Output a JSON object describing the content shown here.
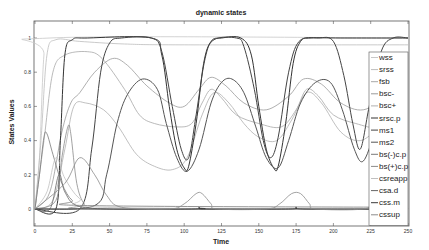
{
  "chart_data": {
    "type": "line",
    "title": "dynamic states",
    "xlabel": "Time",
    "ylabel": "States Values",
    "xlim": [
      0,
      250
    ],
    "ylim": [
      -0.1,
      1.05
    ],
    "xticks": [
      0,
      25,
      50,
      75,
      100,
      125,
      150,
      175,
      200,
      225,
      250
    ],
    "yticks": [
      0,
      0.2,
      0.4,
      0.6,
      0.8,
      1
    ],
    "ytick_labels": [
      "0",
      "0.2",
      "0.4",
      "0.6",
      "0.8",
      "1"
    ],
    "grid": false,
    "legend_position": "east-inside",
    "series": [
      {
        "name": "wss",
        "color": "#c8c8c8",
        "width": 0.8,
        "points": [
          [
            0,
            0
          ],
          [
            3,
            0.3
          ],
          [
            6,
            0.9
          ],
          [
            10,
            1.0
          ],
          [
            250,
            1.0
          ]
        ]
      },
      {
        "name": "srss",
        "color": "#bdbdbd",
        "width": 0.8,
        "points": [
          [
            0,
            0
          ],
          [
            4,
            0.4
          ],
          [
            8,
            0.9
          ],
          [
            14,
            0.99
          ],
          [
            30,
            0.98
          ],
          [
            60,
            0.965
          ],
          [
            100,
            0.96
          ],
          [
            250,
            0.96
          ]
        ]
      },
      {
        "name": "fsb",
        "color": "#a8a8a8",
        "width": 0.8,
        "points": [
          [
            0,
            0
          ],
          [
            6,
            0.4
          ],
          [
            12,
            0.8
          ],
          [
            20,
            0.9
          ],
          [
            35,
            0.92
          ],
          [
            45,
            0.88
          ],
          [
            60,
            0.7
          ],
          [
            70,
            0.55
          ],
          [
            80,
            0.5
          ],
          [
            95,
            0.48
          ],
          [
            105,
            0.5
          ],
          [
            112,
            0.62
          ],
          [
            118,
            0.7
          ],
          [
            125,
            0.65
          ],
          [
            135,
            0.55
          ],
          [
            150,
            0.5
          ],
          [
            165,
            0.48
          ],
          [
            175,
            0.58
          ],
          [
            182,
            0.7
          ],
          [
            190,
            0.66
          ],
          [
            200,
            0.55
          ],
          [
            215,
            0.5
          ],
          [
            230,
            0.48
          ],
          [
            240,
            0.58
          ],
          [
            250,
            0.62
          ]
        ]
      },
      {
        "name": "bsc-",
        "color": "#9a9a9a",
        "width": 0.8,
        "points": [
          [
            0,
            0
          ],
          [
            10,
            0.1
          ],
          [
            18,
            0.45
          ],
          [
            24,
            0.62
          ],
          [
            30,
            0.68
          ],
          [
            40,
            0.8
          ],
          [
            52,
            0.88
          ],
          [
            62,
            0.84
          ],
          [
            75,
            0.72
          ],
          [
            90,
            0.62
          ],
          [
            100,
            0.6
          ],
          [
            110,
            0.7
          ],
          [
            118,
            0.77
          ],
          [
            128,
            0.72
          ],
          [
            140,
            0.62
          ],
          [
            155,
            0.58
          ],
          [
            170,
            0.66
          ],
          [
            180,
            0.76
          ],
          [
            192,
            0.73
          ],
          [
            205,
            0.62
          ],
          [
            220,
            0.58
          ],
          [
            235,
            0.66
          ],
          [
            242,
            0.76
          ],
          [
            250,
            0.72
          ]
        ]
      },
      {
        "name": "bsc+",
        "color": "#b0b0b0",
        "width": 0.8,
        "points": [
          [
            0,
            0
          ],
          [
            12,
            0.05
          ],
          [
            20,
            0.35
          ],
          [
            26,
            0.6
          ],
          [
            34,
            0.62
          ],
          [
            46,
            0.58
          ],
          [
            56,
            0.48
          ],
          [
            68,
            0.32
          ],
          [
            80,
            0.25
          ],
          [
            92,
            0.23
          ],
          [
            102,
            0.3
          ],
          [
            112,
            0.55
          ],
          [
            120,
            0.68
          ],
          [
            130,
            0.62
          ],
          [
            140,
            0.5
          ],
          [
            150,
            0.42
          ],
          [
            162,
            0.4
          ],
          [
            172,
            0.52
          ],
          [
            182,
            0.68
          ],
          [
            192,
            0.62
          ],
          [
            205,
            0.45
          ],
          [
            218,
            0.4
          ],
          [
            230,
            0.48
          ],
          [
            242,
            0.62
          ],
          [
            250,
            0.68
          ]
        ]
      },
      {
        "name": "srsc.p",
        "color": "#333333",
        "width": 1.0,
        "points": [
          [
            0,
            0
          ],
          [
            14,
            0
          ],
          [
            17,
            0.4
          ],
          [
            20,
            0.9
          ],
          [
            25,
            0.99
          ],
          [
            35,
            1.0
          ],
          [
            78,
            1.0
          ],
          [
            85,
            0.9
          ],
          [
            90,
            0.6
          ],
          [
            95,
            0.35
          ],
          [
            100,
            0.24
          ],
          [
            103,
            0.25
          ],
          [
            108,
            0.5
          ],
          [
            113,
            0.85
          ],
          [
            118,
            0.98
          ],
          [
            125,
            1.0
          ],
          [
            138,
            1.0
          ],
          [
            145,
            0.9
          ],
          [
            150,
            0.6
          ],
          [
            155,
            0.35
          ],
          [
            160,
            0.24
          ],
          [
            163,
            0.25
          ],
          [
            168,
            0.5
          ],
          [
            173,
            0.85
          ],
          [
            178,
            0.98
          ],
          [
            185,
            1.0
          ],
          [
            205,
            1.0
          ],
          [
            250,
            1.0
          ]
        ]
      },
      {
        "name": "ms1",
        "color": "#444444",
        "width": 1.0,
        "points": [
          [
            0,
            0
          ],
          [
            30,
            0
          ],
          [
            38,
            0.35
          ],
          [
            44,
            0.8
          ],
          [
            50,
            0.97
          ],
          [
            58,
            1.0
          ],
          [
            78,
            1.0
          ],
          [
            85,
            0.92
          ],
          [
            92,
            0.6
          ],
          [
            98,
            0.35
          ],
          [
            103,
            0.3
          ],
          [
            108,
            0.55
          ],
          [
            114,
            0.88
          ],
          [
            120,
            0.99
          ],
          [
            135,
            1.0
          ],
          [
            140,
            0.95
          ],
          [
            147,
            0.7
          ],
          [
            153,
            0.4
          ],
          [
            158,
            0.3
          ],
          [
            163,
            0.42
          ],
          [
            170,
            0.8
          ],
          [
            177,
            0.98
          ],
          [
            190,
            1.0
          ],
          [
            200,
            0.98
          ],
          [
            207,
            0.78
          ],
          [
            213,
            0.5
          ],
          [
            218,
            0.35
          ],
          [
            224,
            0.6
          ],
          [
            232,
            0.92
          ],
          [
            240,
            1.0
          ],
          [
            250,
            1.0
          ]
        ]
      },
      {
        "name": "ms2",
        "color": "#555555",
        "width": 1.0,
        "points": [
          [
            0,
            0
          ],
          [
            40,
            0.02
          ],
          [
            48,
            0.2
          ],
          [
            55,
            0.5
          ],
          [
            62,
            0.67
          ],
          [
            72,
            0.76
          ],
          [
            82,
            0.7
          ],
          [
            88,
            0.5
          ],
          [
            95,
            0.3
          ],
          [
            102,
            0.22
          ],
          [
            110,
            0.35
          ],
          [
            118,
            0.62
          ],
          [
            125,
            0.74
          ],
          [
            132,
            0.76
          ],
          [
            140,
            0.68
          ],
          [
            148,
            0.48
          ],
          [
            155,
            0.3
          ],
          [
            163,
            0.24
          ],
          [
            170,
            0.4
          ],
          [
            178,
            0.62
          ],
          [
            188,
            0.74
          ],
          [
            198,
            0.74
          ],
          [
            206,
            0.58
          ],
          [
            214,
            0.35
          ],
          [
            220,
            0.28
          ],
          [
            228,
            0.45
          ],
          [
            238,
            0.68
          ],
          [
            250,
            0.75
          ]
        ]
      },
      {
        "name": "bs(-)c.p",
        "color": "#7a7a7a",
        "width": 0.8,
        "points": [
          [
            0,
            0
          ],
          [
            3,
            0.2
          ],
          [
            6,
            0.42
          ],
          [
            8,
            0.44
          ],
          [
            12,
            0.32
          ],
          [
            18,
            0.15
          ],
          [
            25,
            0.05
          ],
          [
            35,
            0.02
          ],
          [
            250,
            0.01
          ]
        ]
      },
      {
        "name": "bs(+)c.p",
        "color": "#8a8a8a",
        "width": 0.8,
        "points": [
          [
            0,
            0
          ],
          [
            14,
            0.05
          ],
          [
            18,
            0.3
          ],
          [
            22,
            0.48
          ],
          [
            24,
            0.44
          ],
          [
            28,
            0.15
          ],
          [
            33,
            0.03
          ],
          [
            40,
            0
          ],
          [
            250,
            0
          ]
        ]
      },
      {
        "name": "csreapp",
        "color": "#c0c0c0",
        "width": 0.8,
        "points": [
          [
            0,
            0
          ],
          [
            8,
            0.1
          ],
          [
            14,
            0.3
          ],
          [
            20,
            0.18
          ],
          [
            30,
            0.06
          ],
          [
            45,
            0.01
          ],
          [
            250,
            0
          ]
        ]
      },
      {
        "name": "csa.d",
        "color": "#666666",
        "width": 0.8,
        "points": [
          [
            0,
            0
          ],
          [
            10,
            0
          ],
          [
            16,
            0.2
          ],
          [
            20,
            0.1
          ],
          [
            28,
            0.02
          ],
          [
            50,
            0
          ],
          [
            105,
            0
          ],
          [
            110,
            0.01
          ],
          [
            115,
            0.0
          ],
          [
            170,
            0
          ],
          [
            175,
            0.01
          ],
          [
            180,
            0
          ],
          [
            235,
            0
          ],
          [
            240,
            0.01
          ],
          [
            250,
            0
          ]
        ]
      },
      {
        "name": "css.m",
        "color": "#3a3a3a",
        "width": 0.8,
        "points": [
          [
            0,
            0
          ],
          [
            105,
            0
          ],
          [
            110,
            0.005
          ],
          [
            116,
            0
          ],
          [
            170,
            0
          ],
          [
            175,
            0.005
          ],
          [
            181,
            0
          ],
          [
            232,
            0
          ],
          [
            238,
            0.005
          ],
          [
            245,
            0
          ],
          [
            250,
            0
          ]
        ]
      },
      {
        "name": "cssup",
        "color": "#8c8c8c",
        "width": 0.8,
        "points": [
          [
            0,
            0
          ],
          [
            20,
            0.15
          ],
          [
            30,
            0.3
          ],
          [
            40,
            0.2
          ],
          [
            48,
            0.08
          ],
          [
            58,
            0.01
          ],
          [
            90,
            0
          ],
          [
            100,
            0.03
          ],
          [
            108,
            0.09
          ],
          [
            112,
            0.09
          ],
          [
            118,
            0.03
          ],
          [
            122,
            0
          ],
          [
            155,
            0
          ],
          [
            164,
            0.03
          ],
          [
            172,
            0.09
          ],
          [
            178,
            0.09
          ],
          [
            184,
            0.03
          ],
          [
            188,
            0
          ],
          [
            220,
            0
          ],
          [
            230,
            0.05
          ],
          [
            238,
            0.1
          ],
          [
            244,
            0.08
          ],
          [
            250,
            0
          ]
        ]
      }
    ]
  }
}
